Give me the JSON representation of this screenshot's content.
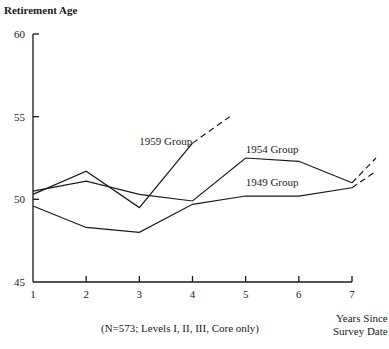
{
  "chart_data": {
    "type": "line",
    "title": "",
    "ylabel": "Retirement Age",
    "xlabel": "Years Since Survey Date",
    "xlabel_lines": [
      "Years Since",
      "Survey Date"
    ],
    "note": "(N=573; Levels I, II, III, Core only)",
    "x": [
      1,
      2,
      3,
      4,
      5,
      6,
      7
    ],
    "xticks": [
      "1",
      "2",
      "3",
      "4",
      "5",
      "6",
      "7"
    ],
    "yticks": [
      "60",
      "55",
      "50",
      "45"
    ],
    "ytick_values": [
      60,
      55,
      50,
      45
    ],
    "ylim": [
      45,
      60
    ],
    "xlim": [
      1,
      7
    ],
    "grid": false,
    "legend_position": "inline labels",
    "series": [
      {
        "name": "1949 Group",
        "x": [
          1,
          2,
          3,
          4,
          5,
          6,
          7
        ],
        "values": [
          49.6,
          48.3,
          48.0,
          49.7,
          50.2,
          50.2,
          50.7
        ],
        "projection": {
          "x": [
            7,
            7.45
          ],
          "values": [
            50.7,
            51.7
          ],
          "style": "dashed"
        }
      },
      {
        "name": "1954 Group",
        "x": [
          1,
          2,
          3,
          4,
          5,
          6,
          7
        ],
        "values": [
          50.5,
          51.1,
          50.3,
          49.9,
          52.5,
          52.3,
          51.0
        ],
        "projection": {
          "x": [
            7,
            7.45
          ],
          "values": [
            51.0,
            52.5
          ],
          "style": "dashed"
        }
      },
      {
        "name": "1959 Group",
        "x": [
          1,
          2,
          3,
          4
        ],
        "values": [
          50.3,
          51.7,
          49.5,
          53.4
        ],
        "projection": {
          "x": [
            4,
            4.7
          ],
          "values": [
            53.4,
            55.0
          ],
          "style": "dashed"
        }
      }
    ],
    "annotations": [
      {
        "text": "1959 Group",
        "x": 3.0,
        "y": 53.3
      },
      {
        "text": "1954 Group",
        "x": 5.0,
        "y": 52.8
      },
      {
        "text": "1949 Group",
        "x": 5.0,
        "y": 50.8
      }
    ]
  }
}
